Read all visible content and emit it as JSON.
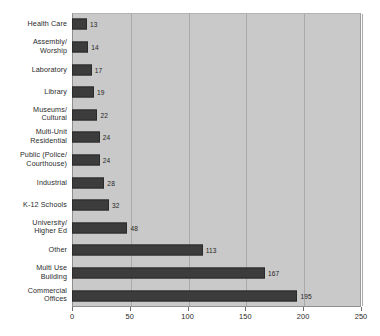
{
  "chart_data": {
    "type": "bar",
    "orientation": "horizontal",
    "title": "",
    "xlabel": "",
    "ylabel": "",
    "xlim": [
      0,
      250
    ],
    "xticks": [
      0,
      50,
      100,
      150,
      200,
      250
    ],
    "grid": true,
    "legend": false,
    "show_value_labels": true,
    "bar_color": "#3c3c3c",
    "plot_background": "#c9c9c9",
    "page_background": "#ffffff",
    "categories": [
      "Health Care",
      "Assembly/\nWorship",
      "Laboratory",
      "Library",
      "Museums/\nCultural",
      "Multi-Unit\nResidential",
      "Public (Police/\nCourthouse)",
      "Industrial",
      "K-12 Schools",
      "University/\nHigher Ed",
      "Other",
      "Multi Use\nBuilding",
      "Commercial\nOffices"
    ],
    "values": [
      13,
      14,
      17,
      19,
      22,
      24,
      24,
      28,
      32,
      48,
      113,
      167,
      195
    ],
    "value_labels": [
      "13",
      "14",
      "17",
      "19",
      "22",
      "24",
      "24",
      "28",
      "32",
      "48",
      "113",
      "167",
      "195"
    ],
    "tick_labels": [
      "0",
      "50",
      "100",
      "150",
      "200",
      "250"
    ]
  }
}
